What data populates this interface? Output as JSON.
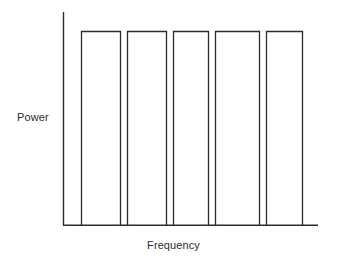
{
  "figure": {
    "background_color": "#ffffff",
    "stroke_color": "#2b2b2b",
    "text_color": "#2b2b2b"
  },
  "labels": {
    "ylabel": "Power",
    "xlabel": "Frequency"
  },
  "chart_data": {
    "type": "bar",
    "title": "",
    "subtitle": "",
    "xlabel": "Frequency",
    "ylabel": "Power",
    "categories": [
      "1",
      "2",
      "3",
      "4",
      "5"
    ],
    "values": [
      1,
      1,
      1,
      1,
      1
    ],
    "series": [
      {
        "name": "Power",
        "values": [
          1,
          1,
          1,
          1,
          1
        ]
      }
    ],
    "bar_fill": "none",
    "bar_outline": "#2b2b2b",
    "grid": false,
    "legend": false,
    "legend_position": "none",
    "xlim": [
      0,
      5
    ],
    "ylim": [
      0,
      1.12
    ],
    "xticks": [],
    "yticks": [],
    "xtick_labels": [],
    "ytick_labels": [],
    "annotations": [],
    "note": "Five equal-height rectangular spectral channels of uniform power spanning the frequency axis; axes are unlabeled schematic lines with no tick marks."
  },
  "geometry": {
    "axis_origin_x": 63,
    "axis_top_y": 12,
    "axis_baseline_y": 225,
    "axis_right_x": 318,
    "bar_top_y": 31,
    "bars": [
      {
        "id": "bar-1",
        "left": 81,
        "right": 121
      },
      {
        "id": "bar-2",
        "left": 127,
        "right": 167
      },
      {
        "id": "bar-3",
        "left": 173,
        "right": 209
      },
      {
        "id": "bar-4",
        "left": 215,
        "right": 260
      },
      {
        "id": "bar-5",
        "left": 266,
        "right": 303
      }
    ]
  }
}
